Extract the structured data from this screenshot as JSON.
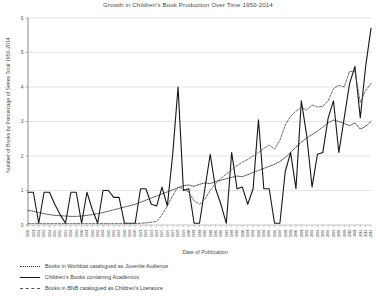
{
  "chart_data": {
    "type": "line",
    "title": "Growth in Children's Book Production Over Time 1950-2014",
    "xlabel": "Date of Publication",
    "ylabel": "Number of Books by Percentage of Series Total 1950-2014",
    "ylim": [
      0,
      6
    ],
    "yticks": [
      0,
      1,
      2,
      3,
      4,
      5,
      6
    ],
    "grid": true,
    "legend_position": "below-left",
    "x": [
      1950,
      1951,
      1952,
      1953,
      1954,
      1955,
      1956,
      1957,
      1958,
      1959,
      1960,
      1961,
      1962,
      1963,
      1964,
      1965,
      1966,
      1967,
      1968,
      1969,
      1970,
      1971,
      1972,
      1973,
      1974,
      1975,
      1976,
      1977,
      1978,
      1979,
      1980,
      1981,
      1982,
      1983,
      1984,
      1985,
      1986,
      1987,
      1988,
      1989,
      1990,
      1991,
      1992,
      1993,
      1994,
      1995,
      1996,
      1997,
      1998,
      1999,
      2000,
      2001,
      2002,
      2003,
      2004,
      2005,
      2006,
      2007,
      2008,
      2009,
      2010,
      2011,
      2012,
      2013,
      2014
    ],
    "series": [
      {
        "name": "Books in Worldcat catalogued as Juvenile Audience",
        "style": "dotted",
        "color": "#2b2b2b",
        "values": [
          0.42,
          0.4,
          0.36,
          0.33,
          0.3,
          0.28,
          0.27,
          0.26,
          0.25,
          0.25,
          0.26,
          0.28,
          0.3,
          0.33,
          0.36,
          0.4,
          0.44,
          0.48,
          0.52,
          0.56,
          0.6,
          0.66,
          0.72,
          0.78,
          0.84,
          0.9,
          0.96,
          1.02,
          1.08,
          1.14,
          1.16,
          1.12,
          1.18,
          1.22,
          1.2,
          1.26,
          1.3,
          1.34,
          1.38,
          1.42,
          1.4,
          1.46,
          1.52,
          1.58,
          1.64,
          1.7,
          1.76,
          1.84,
          1.96,
          2.1,
          2.26,
          2.4,
          2.52,
          2.62,
          2.72,
          2.84,
          2.96,
          3.04,
          3.0,
          2.94,
          2.88,
          2.96,
          2.78,
          2.86,
          3.0
        ]
      },
      {
        "name": "Children's Books containing Academics",
        "style": "solid",
        "color": "#161616",
        "values": [
          0.95,
          0.95,
          0.05,
          0.95,
          0.95,
          0.6,
          0.3,
          0.05,
          0.95,
          0.95,
          0.05,
          0.95,
          0.45,
          0.05,
          1.0,
          1.0,
          0.8,
          0.8,
          0.05,
          0.05,
          0.05,
          1.05,
          1.05,
          0.6,
          0.55,
          1.1,
          0.55,
          2.05,
          4.0,
          1.0,
          1.05,
          0.05,
          0.05,
          1.05,
          2.05,
          1.05,
          0.6,
          0.05,
          2.1,
          1.05,
          1.1,
          0.6,
          1.05,
          3.05,
          1.05,
          1.05,
          0.05,
          0.05,
          1.55,
          2.1,
          1.05,
          3.6,
          2.6,
          1.1,
          2.05,
          2.1,
          3.1,
          3.6,
          2.1,
          3.1,
          4.1,
          4.6,
          3.1,
          4.6,
          5.7
        ]
      },
      {
        "name": "Books in BNB catalogued as Children's Literature",
        "style": "dashed",
        "color": "#555555",
        "values": [
          0.04,
          0.04,
          0.04,
          0.04,
          0.04,
          0.04,
          0.04,
          0.04,
          0.04,
          0.04,
          0.04,
          0.04,
          0.04,
          0.04,
          0.04,
          0.04,
          0.04,
          0.04,
          0.04,
          0.04,
          0.04,
          0.05,
          0.06,
          0.08,
          0.1,
          0.3,
          0.55,
          0.85,
          1.1,
          1.05,
          0.95,
          0.7,
          0.6,
          0.75,
          1.0,
          1.2,
          1.35,
          1.48,
          1.6,
          1.72,
          1.82,
          1.9,
          2.0,
          2.1,
          2.22,
          2.32,
          2.2,
          2.45,
          2.9,
          3.15,
          3.3,
          3.4,
          3.34,
          3.48,
          3.42,
          3.44,
          3.6,
          3.95,
          4.05,
          4.0,
          4.45,
          4.45,
          3.55,
          3.9,
          4.1
        ]
      }
    ]
  },
  "axes": {
    "ytick_labels": [
      "0",
      "1",
      "2",
      "3",
      "4",
      "5",
      "6"
    ]
  }
}
